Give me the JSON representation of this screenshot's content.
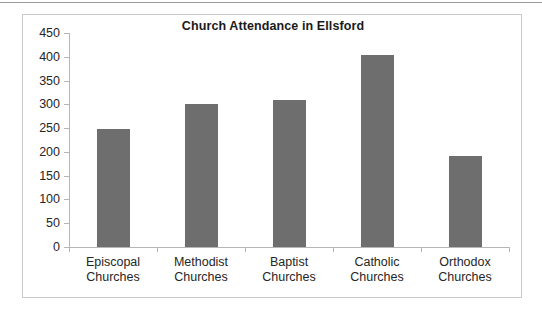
{
  "chart_data": {
    "type": "bar",
    "title": "Church Attendance in Ellsford",
    "xlabel": "",
    "ylabel": "",
    "categories": [
      "Episcopal\nChurches",
      "Methodist\nChurches",
      "Baptist\nChurches",
      "Catholic\nChurches",
      "Orthodox\nChurches"
    ],
    "category_lines": [
      [
        "Episcopal",
        "Churches"
      ],
      [
        "Methodist",
        "Churches"
      ],
      [
        "Baptist",
        "Churches"
      ],
      [
        "Catholic",
        "Churches"
      ],
      [
        "Orthodox",
        "Churches"
      ]
    ],
    "values": [
      248,
      300,
      310,
      403,
      192
    ],
    "ylim": [
      0,
      450
    ],
    "ytick_step": 50,
    "yticks": [
      0,
      50,
      100,
      150,
      200,
      250,
      300,
      350,
      400,
      450
    ],
    "ytick_labels": [
      "0",
      "50",
      "100",
      "150",
      "200",
      "250",
      "300",
      "350",
      "400",
      "450"
    ],
    "grid": false,
    "legend": false,
    "legend_position": "none",
    "bar_color": "#6e6e6e",
    "axis_color": "#b6b6b6",
    "frame_color": "#c9c9c9",
    "text_color": "#262626",
    "background": "#ffffff"
  }
}
